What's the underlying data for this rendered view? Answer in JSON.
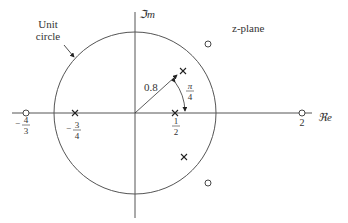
{
  "diagram": {
    "title": "z-plane",
    "axes": {
      "imag_label": "ℑm",
      "real_label": "ℜe"
    },
    "unit_circle_label": [
      "Unit",
      "circle"
    ],
    "radius_label": "0.8",
    "angle_label": {
      "num": "π",
      "den": "4"
    },
    "tick_labels": [
      {
        "id": "zero-neg-4-3",
        "sign": "−",
        "num": "4",
        "den": "3"
      },
      {
        "id": "pole-neg-3-4",
        "sign": "−",
        "num": "3",
        "den": "4"
      },
      {
        "id": "pole-1-2",
        "sign": "",
        "num": "1",
        "den": "2"
      },
      {
        "id": "zero-2",
        "value": "2"
      }
    ],
    "poles": [
      {
        "re": -0.75,
        "im": 0
      },
      {
        "re": 0.5,
        "im": 0
      },
      {
        "re": 0.566,
        "im": 0.566
      },
      {
        "re": 0.566,
        "im": -0.566
      }
    ],
    "zeros": [
      {
        "re": -1.333,
        "im": 0
      },
      {
        "re": 2,
        "im": 0
      },
      {
        "re": 0.9,
        "im": 0.85
      },
      {
        "re": 0.9,
        "im": -0.85
      }
    ],
    "colors": {
      "line": "#444444",
      "text": "#333333"
    }
  }
}
